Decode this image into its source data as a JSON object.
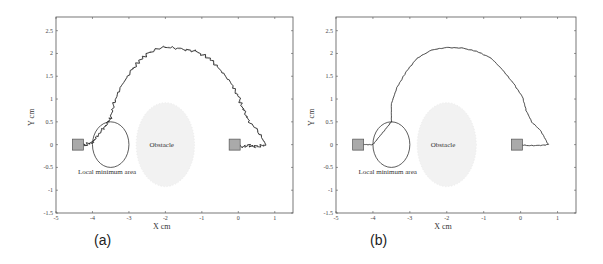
{
  "chart_data": [
    {
      "panel": "(a)",
      "type": "line",
      "title": "",
      "xlabel": "X cm",
      "ylabel": "Y cm",
      "xlim": [
        -5,
        1.5
      ],
      "ylim": [
        -1.5,
        2.8
      ],
      "xticks": [
        -5,
        -4,
        -3,
        -2,
        -1,
        0,
        1
      ],
      "yticks": [
        -1.5,
        -1,
        -0.5,
        0,
        0.5,
        1,
        1.5,
        2,
        2.5
      ],
      "grid": false,
      "annotations": [
        {
          "text": "Obstacle",
          "x": -2.1,
          "y": 0
        },
        {
          "text": "Local minimum area",
          "x": -3.6,
          "y": -0.6
        }
      ],
      "shapes": [
        {
          "kind": "square",
          "label": "goal",
          "x": -4.4,
          "y": 0,
          "fill": "#aaaaaa"
        },
        {
          "kind": "square",
          "label": "start",
          "x": -0.1,
          "y": 0,
          "fill": "#aaaaaa"
        },
        {
          "kind": "ellipse",
          "label": "local-minimum-area",
          "cx": -3.5,
          "cy": 0,
          "rx": 0.5,
          "ry": 0.5
        },
        {
          "kind": "circle",
          "label": "obstacle",
          "cx": -2.0,
          "cy": 0,
          "r": 0.8,
          "fill": "#f2f2f2"
        }
      ],
      "series": [
        {
          "name": "trajectory (noisy)",
          "x": [
            -0.05,
            0.1,
            0.3,
            0.5,
            0.75,
            0.55,
            0.3,
            0.15,
            0.0,
            -0.2,
            -0.5,
            -0.8,
            -1.2,
            -1.6,
            -2.0,
            -2.4,
            -2.7,
            -2.95,
            -3.2,
            -3.4,
            -3.5,
            -3.6,
            -3.75,
            -3.9,
            -4.0,
            -4.2,
            -4.4
          ],
          "y": [
            0.0,
            -0.05,
            -0.02,
            -0.05,
            0.0,
            0.3,
            0.5,
            0.75,
            1.05,
            1.35,
            1.65,
            1.9,
            2.05,
            2.1,
            2.15,
            2.05,
            1.85,
            1.6,
            1.3,
            0.95,
            0.6,
            0.45,
            0.3,
            0.15,
            0.05,
            0.0,
            0.0
          ]
        }
      ]
    },
    {
      "panel": "(b)",
      "type": "line",
      "title": "",
      "xlabel": "X cm",
      "ylabel": "Y cm",
      "xlim": [
        -5,
        1.5
      ],
      "ylim": [
        -1.5,
        2.8
      ],
      "xticks": [
        -5,
        -4,
        -3,
        -2,
        -1,
        0,
        1
      ],
      "yticks": [
        -1.5,
        -1,
        -0.5,
        0,
        0.5,
        1,
        1.5,
        2,
        2.5
      ],
      "grid": false,
      "annotations": [
        {
          "text": "Obstacle",
          "x": -2.1,
          "y": 0
        },
        {
          "text": "Local minimum area",
          "x": -3.6,
          "y": -0.6
        }
      ],
      "shapes": [
        {
          "kind": "square",
          "label": "goal",
          "x": -4.4,
          "y": 0,
          "fill": "#aaaaaa"
        },
        {
          "kind": "square",
          "label": "start",
          "x": -0.1,
          "y": 0,
          "fill": "#aaaaaa"
        },
        {
          "kind": "ellipse",
          "label": "local-minimum-area",
          "cx": -3.5,
          "cy": 0,
          "rx": 0.5,
          "ry": 0.5
        },
        {
          "kind": "circle",
          "label": "obstacle",
          "cx": -2.0,
          "cy": 0,
          "r": 0.8,
          "fill": "#f2f2f2"
        }
      ],
      "series": [
        {
          "name": "trajectory (smooth)",
          "x": [
            -0.05,
            0.2,
            0.5,
            0.75,
            0.55,
            0.3,
            0.15,
            0.05,
            -0.2,
            -0.5,
            -0.8,
            -1.2,
            -1.6,
            -2.0,
            -2.4,
            -2.8,
            -3.1,
            -3.35,
            -3.5,
            -3.5,
            -3.7,
            -3.9,
            -4.0,
            -4.2,
            -4.4
          ],
          "y": [
            0.0,
            -0.02,
            -0.02,
            0.0,
            0.3,
            0.5,
            0.75,
            1.05,
            1.35,
            1.65,
            1.9,
            2.05,
            2.12,
            2.13,
            2.08,
            1.9,
            1.6,
            1.25,
            0.9,
            0.5,
            0.3,
            0.1,
            0.0,
            0.0,
            0.0
          ]
        }
      ]
    }
  ],
  "labels": {
    "panel_a": "(a)",
    "panel_b": "(b)",
    "xlabel": "X cm",
    "ylabel": "Y cm",
    "obstacle": "Obstacle",
    "local_min": "Local minimum area"
  },
  "ticks": {
    "x": [
      "-5",
      "-4",
      "-3",
      "-2",
      "-1",
      "0",
      "1"
    ],
    "y": [
      "-1.5",
      "-1",
      "-0.5",
      "0",
      "0.5",
      "1",
      "1.5",
      "2",
      "2.5"
    ]
  }
}
